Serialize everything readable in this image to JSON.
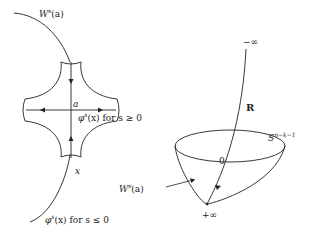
{
  "figure": {
    "left_panel": {
      "stable_manifold_label": "W",
      "stable_manifold_sup": "s",
      "stable_manifold_arg": "(a)",
      "critical_point_label": "a",
      "flow_forward_label_fn": "φ",
      "flow_forward_label_sup": "s",
      "flow_forward_label_arg": "(x)",
      "flow_forward_label_cond": " for s ≥ 0",
      "point_label": "x",
      "flow_backward_label_fn": "φ",
      "flow_backward_label_sup": "s",
      "flow_backward_label_arg": "(x)",
      "flow_backward_label_cond": " for s ≤ 0"
    },
    "right_panel": {
      "minus_infinity_label": "−∞",
      "R_label": "R",
      "sphere_label": "S",
      "sphere_sup": "n−k−1",
      "origin_label": "0",
      "stable_manifold_label": "W",
      "stable_manifold_sup": "s",
      "stable_manifold_arg": "(a)",
      "plus_infinity_label": "+∞"
    },
    "colors": {
      "stroke": "#222222",
      "background": "#ffffff"
    }
  }
}
